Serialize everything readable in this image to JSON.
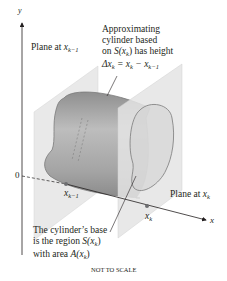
{
  "figure": {
    "axes": {
      "y_label": "y",
      "x_label": "x",
      "origin_label": "0"
    },
    "labels": {
      "plane_left": {
        "text": "Plane at ",
        "var": "x",
        "sub": "k−1"
      },
      "plane_right": {
        "text": "Plane at ",
        "var": "x",
        "sub": "k"
      },
      "cylinder_note": {
        "line1": "Approximating",
        "line2": "cylinder based",
        "line3_pre": "on ",
        "line3_var": "S(x",
        "line3_sub": "k",
        "line3_post": ") has height",
        "line4_delta": "Δx",
        "line4_sub1": "k",
        "line4_eq": " = x",
        "line4_sub2": "k",
        "line4_minus": " − x",
        "line4_sub3": "k−1"
      },
      "base_note": {
        "line1": "The cylinder’s base",
        "line2_pre": "is the region ",
        "line2_var": "S(x",
        "line2_sub": "k",
        "line2_post": ")",
        "line3_pre": "with area ",
        "line3_var": "A(x",
        "line3_sub": "k",
        "line3_post": ")"
      },
      "point_left": {
        "var": "x",
        "sub": "k−1"
      },
      "point_right": {
        "var": "x",
        "sub": "k"
      }
    },
    "footer": "NOT TO SCALE",
    "colors": {
      "plane_fill": "#e6e6e6",
      "cylinder_fill": "#a9a9a9",
      "cylinder_edge": "#808080",
      "axis": "#231f20",
      "point": "#6d6e71"
    }
  }
}
